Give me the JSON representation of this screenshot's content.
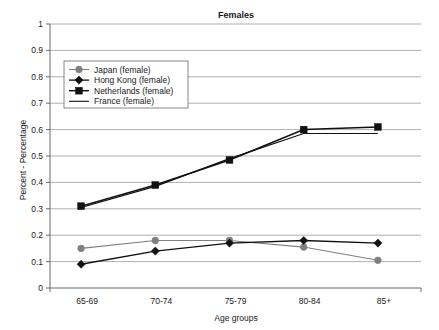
{
  "chart_data": {
    "type": "line",
    "title": "Females",
    "xlabel": "Age groups",
    "ylabel": "Percent - Percentage",
    "categories": [
      "65-69",
      "70-74",
      "75-79",
      "80-84",
      "85+"
    ],
    "ylim": [
      0,
      1
    ],
    "ytick_labels": [
      "0",
      "0.1",
      "0.2",
      "0.3",
      "0.4",
      "0.5",
      "0.6",
      "0.7",
      "0.8",
      "0.9",
      "1"
    ],
    "ytick_values": [
      0,
      0.1,
      0.2,
      0.3,
      0.4,
      0.5,
      0.6,
      0.7,
      0.8,
      0.9,
      1
    ],
    "grid": true,
    "legend_position": "upper-left-inside",
    "series": [
      {
        "name": "Japan (female)",
        "values": [
          0.15,
          0.18,
          0.18,
          0.155,
          0.105
        ],
        "color": "#808080",
        "marker": "circle",
        "line_width": 1.1
      },
      {
        "name": "Hong Kong (female)",
        "values": [
          0.09,
          0.14,
          0.17,
          0.18,
          0.17
        ],
        "color": "#111111",
        "marker": "diamond",
        "line_width": 1.3
      },
      {
        "name": "Netherlands (female)",
        "values": [
          0.31,
          0.39,
          0.485,
          0.6,
          0.61
        ],
        "color": "#111111",
        "marker": "square",
        "line_width": 1.5
      },
      {
        "name": "France (female)",
        "values": [
          0.305,
          0.385,
          0.49,
          0.585,
          0.585
        ],
        "color": "#111111",
        "marker": "none",
        "line_width": 1.1
      }
    ]
  },
  "legend": {
    "entries": [
      {
        "label": "Japan (female)"
      },
      {
        "label": "Hong Kong (female)"
      },
      {
        "label": "Netherlands (female)"
      },
      {
        "label": "France (female)"
      }
    ]
  }
}
